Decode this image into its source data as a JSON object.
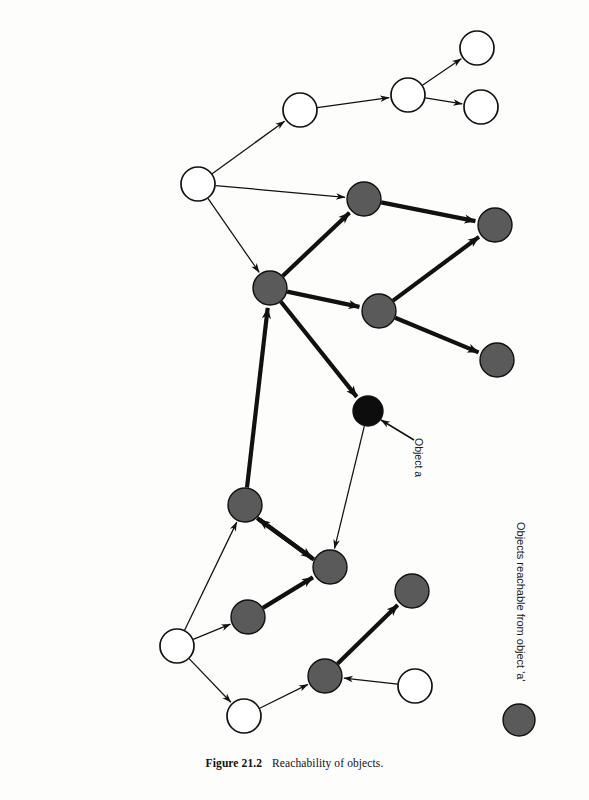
{
  "figure": {
    "caption_label": "Figure 21.2",
    "caption_text": "Reachability of objects.",
    "object_a_label": "Object a",
    "legend_label": "Objects reachable from object 'a'"
  },
  "colors": {
    "reachable_fill": "#5a5a5a",
    "origin_fill": "#0d0d0d",
    "unreachable_fill": "#ffffff",
    "stroke": "#111111",
    "background": "#fdfdfc"
  },
  "graph_data": {
    "type": "diagram",
    "description": "Object reachability graph: nodes are objects, directed edges are references. Shaded nodes are reachable from object 'a'.",
    "node_radius": 17,
    "nodes": [
      {
        "id": "w1",
        "label": "",
        "cx": 300,
        "cy": 110,
        "r": 17,
        "state": "unreachable"
      },
      {
        "id": "w2",
        "label": "",
        "cx": 408,
        "cy": 95,
        "r": 17,
        "state": "unreachable"
      },
      {
        "id": "w3",
        "label": "",
        "cx": 477,
        "cy": 48,
        "r": 17,
        "state": "unreachable"
      },
      {
        "id": "w4",
        "label": "",
        "cx": 481,
        "cy": 107,
        "r": 17,
        "state": "unreachable"
      },
      {
        "id": "w5",
        "label": "",
        "cx": 198,
        "cy": 184,
        "r": 17,
        "state": "unreachable"
      },
      {
        "id": "g1",
        "label": "",
        "cx": 364,
        "cy": 199,
        "r": 17,
        "state": "reachable"
      },
      {
        "id": "g2",
        "label": "",
        "cx": 495,
        "cy": 225,
        "r": 17,
        "state": "reachable"
      },
      {
        "id": "g3",
        "label": "",
        "cx": 270,
        "cy": 288,
        "r": 17,
        "state": "reachable"
      },
      {
        "id": "g4",
        "label": "",
        "cx": 379,
        "cy": 311,
        "r": 17,
        "state": "reachable"
      },
      {
        "id": "g5",
        "label": "",
        "cx": 497,
        "cy": 360,
        "r": 17,
        "state": "reachable"
      },
      {
        "id": "a",
        "label": "Object a",
        "cx": 368,
        "cy": 411,
        "r": 15,
        "state": "origin"
      },
      {
        "id": "g6",
        "label": "",
        "cx": 245,
        "cy": 505,
        "r": 17,
        "state": "reachable"
      },
      {
        "id": "g7",
        "label": "",
        "cx": 330,
        "cy": 567,
        "r": 17,
        "state": "reachable"
      },
      {
        "id": "g8",
        "label": "",
        "cx": 248,
        "cy": 617,
        "r": 17,
        "state": "reachable"
      },
      {
        "id": "w6",
        "label": "",
        "cx": 177,
        "cy": 646,
        "r": 17,
        "state": "unreachable"
      },
      {
        "id": "w7",
        "label": "",
        "cx": 244,
        "cy": 716,
        "r": 17,
        "state": "unreachable"
      },
      {
        "id": "g9",
        "label": "",
        "cx": 325,
        "cy": 676,
        "r": 17,
        "state": "reachable"
      },
      {
        "id": "g10",
        "label": "",
        "cx": 412,
        "cy": 591,
        "r": 17,
        "state": "reachable"
      },
      {
        "id": "w8",
        "label": "",
        "cx": 415,
        "cy": 686,
        "r": 17,
        "state": "unreachable"
      }
    ],
    "edges": [
      {
        "from": "w5",
        "to": "w1",
        "weight": "thin"
      },
      {
        "from": "w1",
        "to": "w2",
        "weight": "thin"
      },
      {
        "from": "w2",
        "to": "w3",
        "weight": "thin"
      },
      {
        "from": "w2",
        "to": "w4",
        "weight": "thin"
      },
      {
        "from": "w5",
        "to": "g1",
        "weight": "thin"
      },
      {
        "from": "w5",
        "to": "g3",
        "weight": "thin"
      },
      {
        "from": "g3",
        "to": "g1",
        "weight": "thick"
      },
      {
        "from": "g1",
        "to": "g2",
        "weight": "thick"
      },
      {
        "from": "g3",
        "to": "g4",
        "weight": "thick"
      },
      {
        "from": "g4",
        "to": "g2",
        "weight": "thick"
      },
      {
        "from": "g4",
        "to": "g5",
        "weight": "thick"
      },
      {
        "from": "g3",
        "to": "a",
        "weight": "thick"
      },
      {
        "from": "g6",
        "to": "g3",
        "weight": "thick"
      },
      {
        "from": "a",
        "to": "g7",
        "weight": "thin"
      },
      {
        "from": "g6",
        "to": "g7",
        "weight": "thick"
      },
      {
        "from": "g7",
        "to": "g6",
        "weight": "thick"
      },
      {
        "from": "g8",
        "to": "g7",
        "weight": "thick"
      },
      {
        "from": "w6",
        "to": "g6",
        "weight": "thin"
      },
      {
        "from": "w6",
        "to": "g8",
        "weight": "thin"
      },
      {
        "from": "w6",
        "to": "w7",
        "weight": "thin"
      },
      {
        "from": "w7",
        "to": "g9",
        "weight": "thin"
      },
      {
        "from": "w8",
        "to": "g9",
        "weight": "thin"
      },
      {
        "from": "g9",
        "to": "g10",
        "weight": "thick"
      }
    ],
    "annotation_arrow": {
      "from_x": 414,
      "from_y": 440,
      "to_x": 381,
      "to_y": 420
    },
    "legend": {
      "swatch_cx": 519,
      "swatch_cy": 720,
      "swatch_r": 16,
      "state": "reachable"
    }
  }
}
